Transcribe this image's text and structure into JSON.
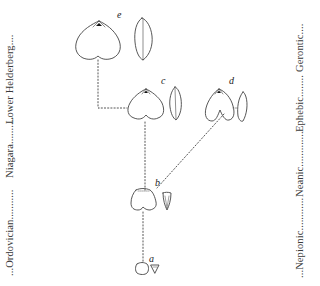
{
  "figure": {
    "type": "phylogenetic-ontogeny diagram of brachiopod shells",
    "left_axis": {
      "label": "Geologic periods",
      "segments": [
        {
          "label": "Ordovician",
          "text": "...Ordovician..........."
        },
        {
          "label": "Niagara",
          "text": "Niagara.........."
        },
        {
          "label": "Lower Helderberg",
          "text": "Lower Helderberg...."
        }
      ]
    },
    "right_axis": {
      "label": "Growth stages",
      "segments": [
        {
          "label": "Nepionic",
          "text": "...Nepionic............"
        },
        {
          "label": "Neanic",
          "text": "Neanic............."
        },
        {
          "label": "Ephebic",
          "text": "Ephebic........"
        },
        {
          "label": "Gerontic",
          "text": "Gerontic...."
        }
      ]
    },
    "specimens": [
      {
        "id": "a",
        "label": "a",
        "stage": "Nepionic"
      },
      {
        "id": "b",
        "label": "b",
        "stage": "Neanic"
      },
      {
        "id": "c",
        "label": "c",
        "stage": "Ephebic"
      },
      {
        "id": "d",
        "label": "d",
        "stage": "Ephebic"
      },
      {
        "id": "e",
        "label": "e",
        "stage": "Gerontic"
      }
    ],
    "connections": [
      {
        "from": "a",
        "to": "b"
      },
      {
        "from": "b",
        "to": "c"
      },
      {
        "from": "b",
        "to": "d"
      },
      {
        "from": "c",
        "to": "e"
      }
    ]
  }
}
